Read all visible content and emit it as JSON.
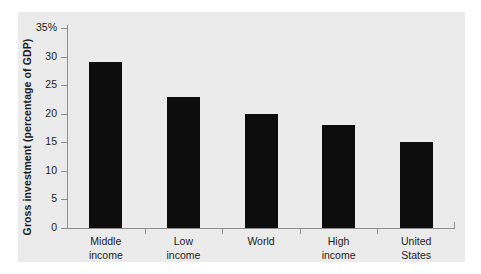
{
  "chart_data": {
    "type": "bar",
    "title": "",
    "xlabel": "",
    "ylabel": "Gross investment (percentage of GDP)",
    "ylim": [
      0,
      35
    ],
    "yticks": [
      0,
      5,
      10,
      15,
      20,
      25,
      30,
      35
    ],
    "ytick_labels": [
      "0",
      "5",
      "10",
      "15",
      "20",
      "25",
      "30",
      "35%"
    ],
    "grid": false,
    "legend": "none",
    "bar_color": "#0d0d0d",
    "axis_color": "#8e8e8e",
    "panel_color": "#ebebeb",
    "categories": [
      "Middle income",
      "Low income",
      "World",
      "High income",
      "United States"
    ],
    "category_lines": [
      [
        "Middle",
        "income"
      ],
      [
        "Low",
        "income"
      ],
      [
        "World",
        ""
      ],
      [
        "High",
        "income"
      ],
      [
        "United",
        "States"
      ]
    ],
    "values": [
      29,
      23,
      20,
      18,
      15
    ]
  }
}
